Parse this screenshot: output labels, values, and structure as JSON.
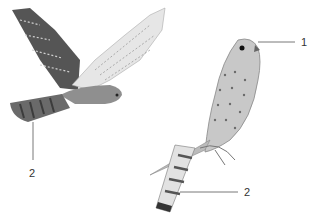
{
  "figure": {
    "labels": [
      {
        "id": "label-1",
        "text": "1",
        "points_to": "head"
      },
      {
        "id": "label-2-flying",
        "text": "2",
        "points_to": "tail of flying bird"
      },
      {
        "id": "label-2-perched",
        "text": "2",
        "points_to": "tail of perched bird"
      }
    ],
    "colors": {
      "dark_wing": "#4a4a4a",
      "light_wing": "#d8d8d8",
      "body": "#9a9a9a",
      "leader_line": "#555555"
    }
  }
}
